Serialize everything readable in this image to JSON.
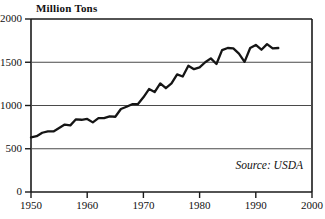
{
  "chart_data": {
    "type": "line",
    "title": "",
    "ylabel": "Million Tons",
    "xlabel": "",
    "xlim": [
      1950,
      2000
    ],
    "ylim": [
      0,
      2000
    ],
    "grid": true,
    "legend": "none",
    "annotations": [
      {
        "name": "source",
        "text": "Source: USDA"
      }
    ],
    "yticks": [
      0,
      500,
      1000,
      1500,
      2000
    ],
    "ytick_labels": [
      "0",
      "500",
      "1000",
      "1500",
      "2000"
    ],
    "xticks": [
      1950,
      1960,
      1970,
      1980,
      1990,
      2000
    ],
    "xtick_labels": [
      "1950",
      "1960",
      "1970",
      "1980",
      "1990",
      "2000"
    ],
    "series": [
      {
        "name": "World Grain Production",
        "color": "#151515",
        "x": [
          1950,
          1951,
          1952,
          1953,
          1954,
          1955,
          1956,
          1957,
          1958,
          1959,
          1960,
          1961,
          1962,
          1963,
          1964,
          1965,
          1966,
          1967,
          1968,
          1969,
          1970,
          1971,
          1972,
          1973,
          1974,
          1975,
          1976,
          1977,
          1978,
          1979,
          1980,
          1981,
          1982,
          1983,
          1984,
          1985,
          1986,
          1987,
          1988,
          1989,
          1990,
          1991,
          1992,
          1993,
          1994
        ],
        "values": [
          631,
          645,
          685,
          700,
          700,
          740,
          780,
          770,
          840,
          835,
          845,
          805,
          855,
          855,
          875,
          870,
          960,
          985,
          1015,
          1015,
          1095,
          1190,
          1155,
          1255,
          1200,
          1255,
          1360,
          1335,
          1460,
          1420,
          1440,
          1500,
          1545,
          1480,
          1640,
          1665,
          1660,
          1600,
          1505,
          1665,
          1700,
          1645,
          1710,
          1660,
          1665
        ]
      }
    ]
  },
  "axes": {
    "ylabel_title": "Million Tons",
    "source_note": "Source: USDA"
  }
}
